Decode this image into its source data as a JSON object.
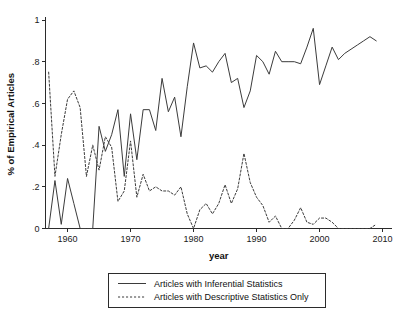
{
  "chart_data": {
    "type": "line",
    "title": "",
    "xlabel": "year",
    "ylabel": "% of Empirical Articles",
    "xlim": [
      1956.5,
      2011.5
    ],
    "ylim": [
      0,
      1
    ],
    "grid": false,
    "legend_position": "below-plot",
    "xticks": [
      1960,
      1970,
      1980,
      1990,
      2000,
      2010
    ],
    "xtick_labels": [
      "1960",
      "1970",
      "1980",
      "1990",
      "2000",
      "2010"
    ],
    "yticks": [
      0,
      0.2,
      0.4,
      0.6,
      0.8,
      1
    ],
    "ytick_labels": [
      "0",
      ".2",
      ".4",
      ".6",
      ".8",
      "1"
    ],
    "x": [
      1957,
      1958,
      1959,
      1960,
      1961,
      1962,
      1963,
      1964,
      1965,
      1966,
      1967,
      1968,
      1969,
      1970,
      1971,
      1972,
      1973,
      1974,
      1975,
      1976,
      1977,
      1978,
      1979,
      1980,
      1981,
      1982,
      1983,
      1984,
      1985,
      1986,
      1987,
      1988,
      1989,
      1990,
      1991,
      1992,
      1993,
      1994,
      1995,
      1996,
      1997,
      1998,
      1999,
      2000,
      2001,
      2002,
      2003,
      2004,
      2005,
      2006,
      2007,
      2008,
      2009
    ],
    "series": [
      {
        "name": "Articles with Inferential Statistics",
        "style": "solid",
        "color": "#3b3b3b",
        "values": [
          0.0,
          0.23,
          0.02,
          0.24,
          0.12,
          0.0,
          0.0,
          0.0,
          0.49,
          0.37,
          0.45,
          0.57,
          0.25,
          0.55,
          0.33,
          0.57,
          0.57,
          0.47,
          0.72,
          0.56,
          0.63,
          0.44,
          0.68,
          0.89,
          0.77,
          0.78,
          0.75,
          0.8,
          0.84,
          0.7,
          0.72,
          0.58,
          0.66,
          0.83,
          0.8,
          0.74,
          0.85,
          0.8,
          0.8,
          0.8,
          0.79,
          0.87,
          0.96,
          0.69,
          0.78,
          0.87,
          0.81,
          0.84,
          0.86,
          0.88,
          0.9,
          0.92,
          0.9
        ]
      },
      {
        "name": "Articles with Descriptive Statistics Only",
        "style": "dashed",
        "color": "#3b3b3b",
        "values": [
          0.75,
          0.25,
          0.45,
          0.62,
          0.66,
          0.58,
          0.25,
          0.4,
          0.28,
          0.44,
          0.39,
          0.13,
          0.18,
          0.42,
          0.15,
          0.26,
          0.18,
          0.2,
          0.18,
          0.18,
          0.16,
          0.2,
          0.07,
          0.0,
          0.09,
          0.12,
          0.07,
          0.12,
          0.21,
          0.12,
          0.19,
          0.36,
          0.22,
          0.15,
          0.11,
          0.03,
          0.06,
          0.0,
          0.0,
          0.04,
          0.1,
          0.03,
          0.02,
          0.05,
          0.05,
          0.03,
          0.0,
          0.0,
          0.0,
          0.0,
          0.0,
          0.0,
          0.02
        ]
      }
    ]
  },
  "legend": {
    "items": [
      {
        "label": "Articles with Inferential Statistics",
        "style": "solid"
      },
      {
        "label": "Articles with Descriptive Statistics Only",
        "style": "dashed"
      }
    ]
  }
}
